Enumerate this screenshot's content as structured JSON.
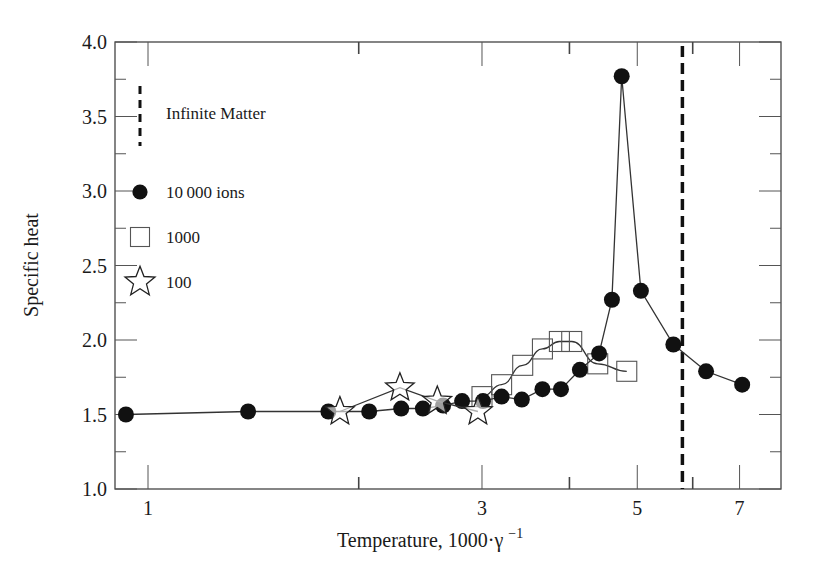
{
  "chart_data": {
    "type": "line",
    "title": "",
    "xlabel": "Temperature, 1000·γ⁻¹",
    "xlabel_main": "Temperature, 1000·γ",
    "xlabel_sup": "−1",
    "ylabel": "Specific heat",
    "x_scale": "log",
    "xlim": [
      0.9,
      8.0
    ],
    "ylim": [
      1.0,
      4.0
    ],
    "grid": false,
    "legend_position": "upper-left (inside)",
    "x_ticks": [
      1,
      3,
      5,
      7
    ],
    "x_tick_labels": [
      "1",
      "3",
      "5",
      "7"
    ],
    "x_minor_ticks": [
      2,
      4,
      6
    ],
    "y_ticks": [
      1.0,
      1.5,
      2.0,
      2.5,
      3.0,
      3.5,
      4.0
    ],
    "y_tick_labels": [
      "1.0",
      "1.5",
      "2.0",
      "2.5",
      "3.0",
      "3.5",
      "4.0"
    ],
    "y_minor_ticks": [
      1.25,
      1.75,
      2.25,
      2.75,
      3.25,
      3.75
    ],
    "series": [
      {
        "name": "10 000 ions",
        "marker": "filled-circle",
        "x": [
          0.93,
          1.39,
          1.81,
          2.07,
          2.3,
          2.47,
          2.64,
          2.81,
          3.01,
          3.2,
          3.42,
          3.66,
          3.89,
          4.14,
          4.41,
          4.6,
          4.75,
          5.06,
          5.63,
          6.27,
          7.06
        ],
        "values": [
          1.5,
          1.52,
          1.52,
          1.52,
          1.54,
          1.54,
          1.56,
          1.59,
          1.59,
          1.62,
          1.6,
          1.67,
          1.67,
          1.8,
          1.91,
          2.27,
          3.77,
          2.33,
          1.97,
          1.79,
          1.7
        ]
      },
      {
        "name": "1000",
        "marker": "open-square",
        "x": [
          3.0,
          3.2,
          3.43,
          3.66,
          3.87,
          4.03,
          4.39,
          4.83
        ],
        "values": [
          1.62,
          1.7,
          1.83,
          1.94,
          1.99,
          1.99,
          1.84,
          1.79
        ]
      },
      {
        "name": "100",
        "marker": "open-star",
        "x": [
          1.88,
          2.29,
          2.59,
          2.96
        ],
        "values": [
          1.52,
          1.68,
          1.59,
          1.52
        ]
      }
    ],
    "reference_lines": [
      {
        "name": "Infinite Matter",
        "orientation": "vertical",
        "x": 5.8,
        "style": "dashed"
      }
    ],
    "legend": [
      {
        "label": "Infinite Matter",
        "symbol": "dashed-line"
      },
      {
        "label": "10 000  ions",
        "symbol": "filled-circle"
      },
      {
        "label": "1000",
        "symbol": "open-square"
      },
      {
        "label": "100",
        "symbol": "open-star"
      }
    ]
  }
}
